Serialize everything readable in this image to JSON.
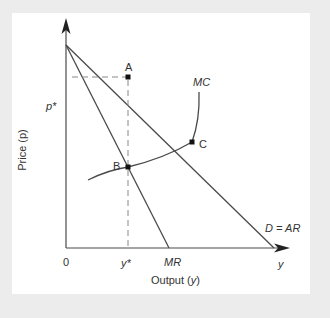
{
  "diagram": {
    "type": "monopoly-pricing",
    "colors": {
      "background": "#ececec",
      "panel": "#ffffff",
      "line": "#4a4a4a",
      "dash": "#888888",
      "text": "#333333"
    },
    "axes": {
      "x_label_prefix": "Output (",
      "x_label_var": "y",
      "x_label_suffix": ")",
      "y_label": "Price (p)",
      "origin": "0",
      "x_axis_end_label": "y"
    },
    "curves": {
      "mc": "MC",
      "mr": "MR",
      "demand": "D = AR"
    },
    "points": {
      "a": "A",
      "b": "B",
      "c": "C"
    },
    "markers": {
      "p_star": "p*",
      "y_star": "y*"
    }
  }
}
